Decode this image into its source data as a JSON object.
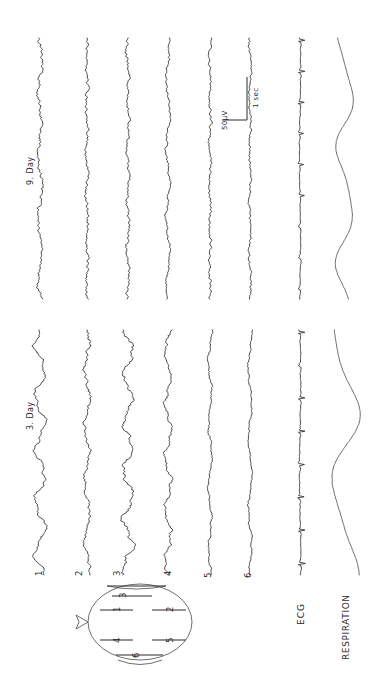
{
  "figure": {
    "type": "polygraph-recording",
    "orientation": "rotated-90-ccw",
    "background_color": "#ffffff",
    "trace_color": "#2a2a2a"
  },
  "sessions": [
    {
      "id": "day9",
      "label": "9. Day"
    },
    {
      "id": "day3",
      "label": "3. Day"
    }
  ],
  "channels": [
    {
      "index": 1,
      "label": "1",
      "kind": "eeg"
    },
    {
      "index": 2,
      "label": "2",
      "kind": "eeg"
    },
    {
      "index": 3,
      "label": "3",
      "kind": "eeg"
    },
    {
      "index": 4,
      "label": "4",
      "kind": "eeg"
    },
    {
      "index": 5,
      "label": "5",
      "kind": "eeg"
    },
    {
      "index": 6,
      "label": "6",
      "kind": "eeg"
    },
    {
      "index": 7,
      "label": "ECG",
      "kind": "ecg"
    },
    {
      "index": 8,
      "label": "RESPIRATION",
      "kind": "respiration"
    }
  ],
  "calibration": {
    "amplitude_label": "50µV",
    "time_label": "1 sec"
  },
  "head_diagram": {
    "name": "electrode-placement-head",
    "nose_direction": "left",
    "electrodes": [
      {
        "label": "1",
        "position": "left-anterior"
      },
      {
        "label": "2",
        "position": "right-anterior"
      },
      {
        "label": "3",
        "position": "vertex-top"
      },
      {
        "label": "4",
        "position": "left-posterior"
      },
      {
        "label": "5",
        "position": "right-posterior"
      },
      {
        "label": "6",
        "position": "occipital-bottom"
      }
    ]
  },
  "chart_data": {
    "type": "line",
    "title": "",
    "xlabel": "",
    "ylabel": "",
    "grid": false,
    "legend": "none",
    "note": "Eight simultaneous vertical time-series traces per session block; time runs downward, amplitude deflects horizontally.",
    "series": [
      {
        "name": "9. Day / 1",
        "kind": "eeg",
        "amplitude": 3.4,
        "frequency": "mixed-fast"
      },
      {
        "name": "9. Day / 2",
        "kind": "eeg",
        "amplitude": 2.4,
        "frequency": "fast-low-voltage"
      },
      {
        "name": "9. Day / 3",
        "kind": "eeg",
        "amplitude": 2.6,
        "frequency": "fast-low-voltage"
      },
      {
        "name": "9. Day / 4",
        "kind": "eeg",
        "amplitude": 3.0,
        "frequency": "mixed"
      },
      {
        "name": "9. Day / 5",
        "kind": "eeg",
        "amplitude": 2.2,
        "frequency": "fast-low-voltage"
      },
      {
        "name": "9. Day / 6",
        "kind": "eeg",
        "amplitude": 2.0,
        "frequency": "fast-low-voltage"
      },
      {
        "name": "9. Day / ECG",
        "kind": "ecg",
        "amplitude": 5.5,
        "frequency": "regular-qrs"
      },
      {
        "name": "9. Day / RESPIRATION",
        "kind": "respiration",
        "amplitude": 9.0,
        "frequency": "slow"
      },
      {
        "name": "3. Day / 1",
        "kind": "eeg",
        "amplitude": 8.5,
        "frequency": "slow-high-voltage"
      },
      {
        "name": "3. Day / 2",
        "kind": "eeg",
        "amplitude": 5.5,
        "frequency": "mixed"
      },
      {
        "name": "3. Day / 3",
        "kind": "eeg",
        "amplitude": 8.0,
        "frequency": "slow-high-voltage"
      },
      {
        "name": "3. Day / 4",
        "kind": "eeg",
        "amplitude": 6.0,
        "frequency": "mixed"
      },
      {
        "name": "3. Day / 5",
        "kind": "eeg",
        "amplitude": 3.0,
        "frequency": "low-voltage"
      },
      {
        "name": "3. Day / 6",
        "kind": "eeg",
        "amplitude": 3.2,
        "frequency": "low-voltage"
      },
      {
        "name": "3. Day / ECG",
        "kind": "ecg",
        "amplitude": 6.0,
        "frequency": "regular-qrs"
      },
      {
        "name": "3. Day / RESPIRATION",
        "kind": "respiration",
        "amplitude": 14.0,
        "frequency": "slow-deep"
      }
    ],
    "axis_ranges": {
      "time_px": [
        38,
        600
      ],
      "channels_x_px": [
        40,
        345
      ]
    },
    "scale_bar": {
      "amplitude": "50µV",
      "time": "1 sec"
    }
  }
}
